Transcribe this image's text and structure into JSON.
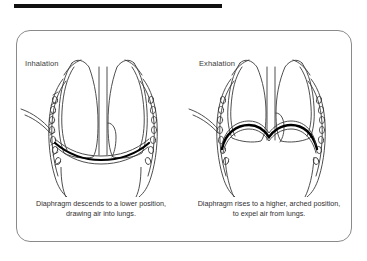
{
  "document": {
    "title": "Diaphragm movement during breathing",
    "top_rule_color": "#111111",
    "frame_border_color": "#8a8a8a",
    "background_color": "#ffffff",
    "line_color": "#3a3a3a",
    "diaphragm_color": "#000000"
  },
  "panels": [
    {
      "key": "inhalation",
      "label": "Inhalation",
      "caption_line_1": "Diaphragm descends to a lower position,",
      "caption_line_2": "drawing air into lungs.",
      "caption": "Diaphragm descends to a lower position, drawing air into lungs.",
      "diaphragm_state": "descended-flattened",
      "anatomy_parts": [
        "left-lung",
        "right-lung",
        "rib-cage",
        "vertebral-column",
        "diaphragm",
        "trachea-hilum"
      ]
    },
    {
      "key": "exhalation",
      "label": "Exhalation",
      "caption_line_1": "Diaphragm rises to a higher, arched position,",
      "caption_line_2": "to expel air from lungs.",
      "caption": "Diaphragm rises to a higher, arched position, to expel air from lungs.",
      "diaphragm_state": "raised-arched",
      "anatomy_parts": [
        "left-lung",
        "right-lung",
        "rib-cage",
        "vertebral-column",
        "diaphragm",
        "trachea-hilum"
      ]
    }
  ]
}
